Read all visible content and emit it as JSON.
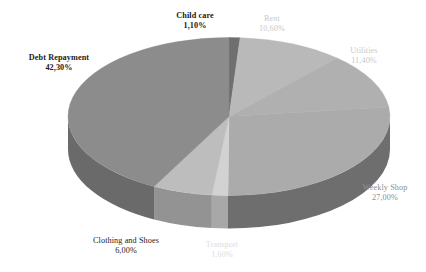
{
  "chart_data": {
    "type": "pie",
    "title": "",
    "subtitle": "",
    "xlabel": "",
    "ylabel": "",
    "legend_position": "none",
    "grid": false,
    "style": "3d-exploded-none",
    "value_suffix": "%",
    "categories": [
      "Child care",
      "Rent",
      "Utilities",
      "Weekly Shop",
      "Transport",
      "Clothing and Shoes",
      "Debt Repayment"
    ],
    "values": [
      1.1,
      10.6,
      11.4,
      27.0,
      1.6,
      6.0,
      42.3
    ],
    "slices": [
      {
        "label": "Child care",
        "value": 1.1,
        "value_text": "1,10%",
        "top_color": "#6f6f6f",
        "side_color": "#4f4f4f",
        "label_color": "#1b1b1b",
        "label_weight": "bold"
      },
      {
        "label": "Rent",
        "value": 10.6,
        "value_text": "10,60%",
        "top_color": "#b9b9b9",
        "side_color": "#8d8d8d",
        "label_color": "#c9c9c9",
        "label_weight": "normal"
      },
      {
        "label": "Utilities",
        "value": 11.4,
        "value_text": "11,40%",
        "top_color": "#b0b0b0",
        "side_color": "#868686",
        "label_color": "#c9c9c9",
        "label_weight": "normal"
      },
      {
        "label": "Weekly Shop",
        "value": 27.0,
        "value_text": "27,00%",
        "top_color": "#ababab",
        "side_color": "#6e6e6e",
        "label_color": "#8e8e8e",
        "label_weight": "normal"
      },
      {
        "label": "Transport",
        "value": 1.6,
        "value_text": "1,60%",
        "top_color": "#d2d2d2",
        "side_color": "#a8a8a8",
        "label_color": "#dcdcdc",
        "label_weight": "normal"
      },
      {
        "label": "Clothing and Shoes",
        "value": 6.0,
        "value_text": "6,00%",
        "top_color": "#bdbdbd",
        "side_color": "#939393",
        "label_color": "#1b1b1b",
        "label_weight": "normal"
      },
      {
        "label": "Debt Repayment",
        "value": 42.3,
        "value_text": "42,30%",
        "top_color": "#8c8c8c",
        "side_color": "#6a6a6a",
        "label_color": "#1b1b1b",
        "label_weight": "bold"
      }
    ],
    "background_color": "#ffffff"
  }
}
